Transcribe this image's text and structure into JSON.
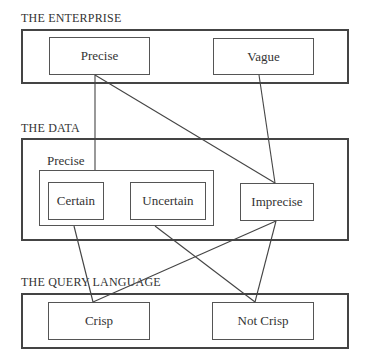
{
  "sections": {
    "enterprise": {
      "label": "THE ENTERPRISE",
      "boxes": [
        "Precise",
        "Vague"
      ]
    },
    "data": {
      "label": "THE DATA",
      "group_label": "Precise",
      "group_boxes": [
        "Certain",
        "Uncertain"
      ],
      "boxes": [
        "Imprecise"
      ]
    },
    "query_language": {
      "label": "THE QUERY LANGUAGE",
      "boxes": [
        "Crisp",
        "Not Crisp"
      ]
    }
  },
  "connections": [
    {
      "from": "Enterprise: Precise",
      "to": "Data: Precise group"
    },
    {
      "from": "Enterprise: Precise",
      "to": "Data: Imprecise"
    },
    {
      "from": "Enterprise: Vague",
      "to": "Data: Imprecise"
    },
    {
      "from": "Data: Certain",
      "to": "Query: Crisp"
    },
    {
      "from": "Data: Precise group",
      "to": "Query: Not Crisp"
    },
    {
      "from": "Data: Imprecise",
      "to": "Query: Crisp"
    },
    {
      "from": "Data: Imprecise",
      "to": "Query: Not Crisp"
    }
  ]
}
